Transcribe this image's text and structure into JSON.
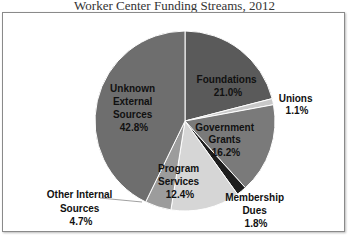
{
  "chart_data": {
    "type": "pie",
    "title": "Worker Center Funding Streams, 2012",
    "start_angle": "12 o'clock, clockwise",
    "slices": [
      {
        "label": "Foundations",
        "value": 21.0,
        "display": "21.0%",
        "color": "#5a5a5a"
      },
      {
        "label": "Unions",
        "value": 1.1,
        "display": "1.1%",
        "color": "#c8c8c8"
      },
      {
        "label": "Government Grants",
        "value": 16.2,
        "display": "16.2%",
        "color": "#7a7a7a"
      },
      {
        "label": "Membership Dues",
        "value": 1.8,
        "display": "1.8%",
        "color": "#1e1e1e"
      },
      {
        "label": "Program Services",
        "value": 12.4,
        "display": "12.4%",
        "color": "#d6d6d6"
      },
      {
        "label": "Other Internal Sources",
        "value": 4.7,
        "display": "4.7%",
        "color": "#9c9c9c"
      },
      {
        "label": "Unknown External Sources",
        "value": 42.8,
        "display": "42.8%",
        "color": "#6e6e6e"
      }
    ],
    "legend": "none (data labels on/near slices)"
  },
  "labels": {
    "foundations": [
      "Foundations",
      "21.0%"
    ],
    "unions": [
      "Unions",
      "1.1%"
    ],
    "government": [
      "Government",
      "Grants",
      "16.2%"
    ],
    "membership": [
      "Membership",
      "Dues",
      "1.8%"
    ],
    "program": [
      "Program",
      "Services",
      "12.4%"
    ],
    "other": [
      "Other Internal",
      "Sources",
      "4.7%"
    ],
    "unknown": [
      "Unknown",
      "External",
      "Sources",
      "42.8%"
    ]
  }
}
